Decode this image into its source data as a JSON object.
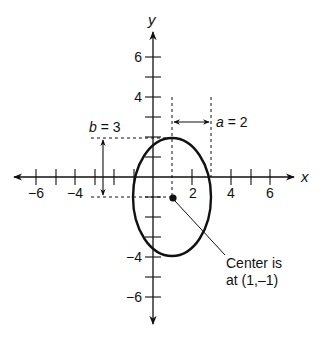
{
  "diagram": {
    "type": "ellipse-on-coordinate-plane",
    "axes": {
      "x_label": "x",
      "y_label": "y",
      "x_range": [
        -7,
        7
      ],
      "y_range": [
        -7,
        7
      ],
      "x_tick_labels": [
        "-6",
        "-4",
        "2",
        "4",
        "6"
      ],
      "x_tick_values": [
        -6,
        -4,
        2,
        4,
        6
      ],
      "y_tick_labels": [
        "6",
        "4",
        "-4",
        "-6"
      ],
      "y_tick_values": [
        6,
        4,
        -4,
        -6
      ]
    },
    "ellipse": {
      "center": [
        1,
        -1
      ],
      "a": 2,
      "b": 3
    },
    "annotations": {
      "a_label": "a = 2",
      "b_label": "b = 3",
      "center_label_line1": "Center is",
      "center_label_line2": "at (1,–1)"
    },
    "colors": {
      "stroke": "#111111",
      "background": "#ffffff"
    }
  }
}
